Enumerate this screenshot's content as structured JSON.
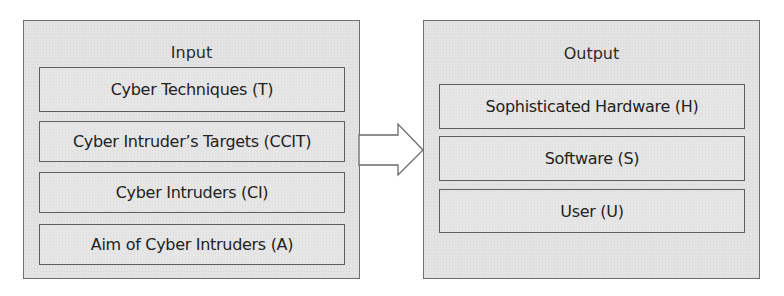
{
  "input": {
    "title": "Input",
    "items": [
      {
        "label": "Cyber Techniques (T)"
      },
      {
        "label": "Cyber Intruder’s Targets (CCIT)"
      },
      {
        "label": "Cyber Intruders (CI)"
      },
      {
        "label": "Aim of Cyber Intruders (A)"
      }
    ]
  },
  "output": {
    "title": "Output",
    "items": [
      {
        "label": "Sophisticated Hardware (H)"
      },
      {
        "label": "Software (S)"
      },
      {
        "label": "User (U)"
      }
    ]
  },
  "arrow": {
    "direction": "right",
    "from": "Input",
    "to": "Output"
  },
  "colors": {
    "panel_fill": "#e3e3e3",
    "border": "#5e5e5e",
    "text": "#222222"
  }
}
